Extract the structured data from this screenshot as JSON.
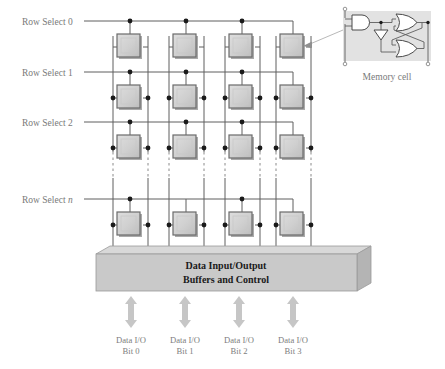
{
  "figure": {
    "row_labels": [
      {
        "text": "Row Select 0",
        "italic_suffix": ""
      },
      {
        "text": "Row Select 1",
        "italic_suffix": ""
      },
      {
        "text": "Row Select 2",
        "italic_suffix": ""
      },
      {
        "text": "Row Select ",
        "italic_suffix": "n"
      }
    ],
    "buffer_block": {
      "line1": "Data Input/Output",
      "line2": "Buffers and Control"
    },
    "io_labels": [
      {
        "line1": "Data I/O",
        "line2": "Bit 0"
      },
      {
        "line1": "Data I/O",
        "line2": "Bit 1"
      },
      {
        "line1": "Data I/O",
        "line2": "Bit 2"
      },
      {
        "line1": "Data I/O",
        "line2": "Bit 3"
      }
    ],
    "memory_cell": {
      "caption": "Memory cell",
      "gates": [
        "and-gate",
        "inverter",
        "nor-gate-upper",
        "nor-gate-lower"
      ],
      "terminals": 3
    },
    "grid": {
      "columns": 4,
      "rows_drawn": 4,
      "rows_elided": true,
      "elision_style": "vertical-dashed"
    },
    "colors": {
      "cell_fill": "#cfcfcf",
      "cell_border": "#6b6b6b",
      "wire": "#5f5f5f",
      "node_dot": "#1a1a1a",
      "block_front": "#c9c9c9",
      "block_top": "#d8d8d8",
      "block_side": "#b4b4b4",
      "arrow": "#c6c6c6",
      "cell_panel_bg": "#e2e2e2",
      "label_text": "#7a7a7a",
      "block_text": "#1a1a1a"
    }
  }
}
